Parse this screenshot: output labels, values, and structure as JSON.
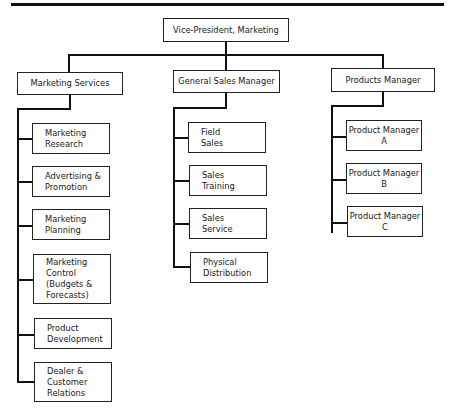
{
  "chart_title": "Marketing Department Organization Chart",
  "root": {
    "label": "Vice-President, Marketing"
  },
  "departments": [
    {
      "label": "Marketing Services",
      "children": [
        "Marketing\nResearch",
        "Advertising &\nPromotion",
        "Marketing\nPlanning",
        "Marketing\nControl\n(Budgets &\n Forecasts)",
        "Product\nDevelopment",
        "Dealer &\nCustomer\nRelations"
      ]
    },
    {
      "label": "General Sales Manager",
      "children": [
        "Field\nSales",
        "Sales\nTraining",
        "Sales\nService",
        "Physical\nDistribution"
      ]
    },
    {
      "label": "Products Manager",
      "children": [
        "Product Manager\nA",
        "Product Manager\nB",
        "Product Manager\nC"
      ]
    }
  ]
}
